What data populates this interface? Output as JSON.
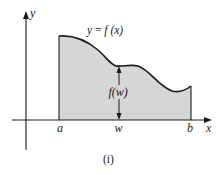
{
  "diagram": {
    "type": "area-under-curve",
    "colors": {
      "background": "#ffffff",
      "fill": "#d6d6d6",
      "stroke": "#1a1a1a"
    },
    "axes": {
      "x_label": "x",
      "y_label": "y"
    },
    "curve_label": "y = f (x)",
    "curve_label_parts": {
      "lhs": "y",
      "eq": " = ",
      "fn": "f",
      "arg": " (x)"
    },
    "height_label": "f (w)",
    "height_label_parts": {
      "fn": "f",
      "arg": "(w)"
    },
    "x_ticks": [
      {
        "label": "a"
      },
      {
        "label": "w"
      },
      {
        "label": "b"
      }
    ],
    "caption": "(i)"
  }
}
